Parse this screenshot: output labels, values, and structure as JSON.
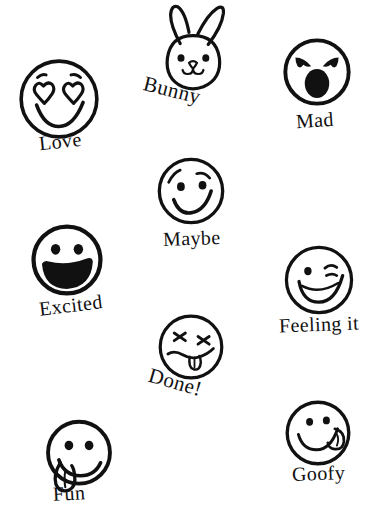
{
  "sheet": {
    "title": "Emoji Sticker Sheet",
    "background_color": "#ffffff",
    "ink_color": "#111111",
    "width": 373,
    "height": 519,
    "style": "hand-drawn black ink doodle stickers with serif captions"
  },
  "stickers": [
    {
      "id": "love",
      "label": "Love",
      "icon": "heart-eyes-smiley-icon",
      "face_x": 16,
      "face_y": 56,
      "face_size": 86,
      "label_x": 39,
      "label_y": 131,
      "label_size": 20,
      "label_rotation": -6,
      "features": "heart eyes with eyebrow ticks, wide smile"
    },
    {
      "id": "bunny",
      "label": "Bunny",
      "icon": "bunny-head-icon",
      "face_x": 153,
      "face_y": 2,
      "face_size": 80,
      "label_x": 143,
      "label_y": 78,
      "label_size": 21,
      "label_rotation": 14,
      "features": "long ears, dot eyes, small nose and mouth"
    },
    {
      "id": "mad",
      "label": "Mad",
      "icon": "angry-shouting-face-icon",
      "face_x": 281,
      "face_y": 36,
      "face_size": 72,
      "label_x": 296,
      "label_y": 110,
      "label_size": 20,
      "label_rotation": -4,
      "features": "angry slanted brows, filled oval shouting mouth"
    },
    {
      "id": "maybe",
      "label": "Maybe",
      "icon": "smirking-face-icon",
      "face_x": 155,
      "face_y": 155,
      "face_size": 72,
      "label_x": 163,
      "label_y": 228,
      "label_size": 20,
      "label_rotation": -2,
      "features": "raised brow, dot eyes, sideways smirk"
    },
    {
      "id": "excited",
      "label": "Excited",
      "icon": "grinning-open-mouth-face-icon",
      "face_x": 29,
      "face_y": 222,
      "face_size": 76,
      "label_x": 39,
      "label_y": 295,
      "label_size": 20,
      "label_rotation": -7,
      "features": "dot eyes, big filled open grin"
    },
    {
      "id": "feeling-it",
      "label": "Feeling it",
      "icon": "winking-face-icon",
      "face_x": 282,
      "face_y": 243,
      "face_size": 74,
      "label_x": 279,
      "label_y": 314,
      "label_size": 20,
      "label_rotation": -2,
      "features": "one dot eye, one winking eye, open smile"
    },
    {
      "id": "done",
      "label": "Done!",
      "icon": "dead-x-eyes-tongue-face-icon",
      "face_x": 156,
      "face_y": 312,
      "face_size": 70,
      "label_x": 148,
      "label_y": 370,
      "label_size": 21,
      "label_rotation": 16,
      "features": "X eyes, wavy mouth, hanging tongue"
    },
    {
      "id": "fun",
      "label": "Fun",
      "icon": "tongue-out-face-icon",
      "face_x": 43,
      "face_y": 418,
      "face_size": 72,
      "label_x": 53,
      "label_y": 483,
      "label_size": 20,
      "label_rotation": -3,
      "features": "dot eyes, smile with tongue out the left side"
    },
    {
      "id": "goofy",
      "label": "Goofy",
      "icon": "licking-lips-face-icon",
      "face_x": 283,
      "face_y": 398,
      "face_size": 70,
      "label_x": 292,
      "label_y": 463,
      "label_size": 20,
      "label_rotation": -2,
      "features": "dot eyes, smile with tongue licking right corner"
    }
  ]
}
